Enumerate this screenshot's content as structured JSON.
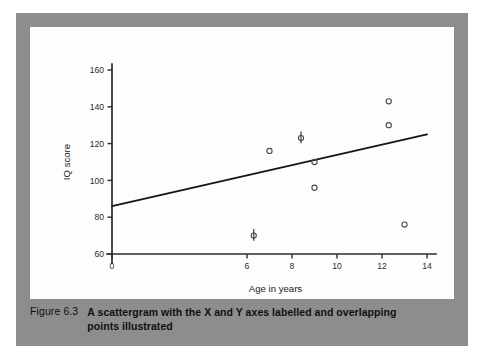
{
  "figure": {
    "caption_label": "Figure 6.3",
    "caption_text": "A scattergram with the X and Y axes labelled and overlapping points illustrated"
  },
  "colors": {
    "frame": "#8d8d8d",
    "panel": "#fdfdfd",
    "axis": "#2b2b2b",
    "trend_line": "#161616",
    "marker": "#4a4a4a"
  },
  "chart_data": {
    "type": "scatter",
    "title": "",
    "xlabel": "Age in years",
    "ylabel": "IQ score",
    "xlim": [
      0,
      14
    ],
    "ylim": [
      60,
      160
    ],
    "grid": false,
    "legend": "none",
    "x_ticks": [
      0,
      6,
      8,
      10,
      12,
      14
    ],
    "x_tick_labels": [
      "0",
      "6",
      "8",
      "10",
      "12",
      "14"
    ],
    "y_ticks": [
      60,
      80,
      100,
      120,
      140,
      160
    ],
    "y_tick_labels": [
      "60",
      "80",
      "100",
      "120",
      "140",
      "160"
    ],
    "points": [
      {
        "x": 7.0,
        "y": 116,
        "marker": "open-circle",
        "overlapping": false
      },
      {
        "x": 8.4,
        "y": 123,
        "marker": "overlapping-point",
        "overlapping": true
      },
      {
        "x": 9.0,
        "y": 110,
        "marker": "open-circle",
        "overlapping": false
      },
      {
        "x": 9.0,
        "y": 96,
        "marker": "open-circle",
        "overlapping": false
      },
      {
        "x": 6.3,
        "y": 70,
        "marker": "overlapping-point",
        "overlapping": true
      },
      {
        "x": 12.3,
        "y": 143,
        "marker": "open-circle",
        "overlapping": false
      },
      {
        "x": 12.3,
        "y": 130,
        "marker": "open-circle",
        "overlapping": false
      },
      {
        "x": 13.0,
        "y": 76,
        "marker": "open-circle",
        "overlapping": false
      }
    ],
    "trend_line": {
      "type": "line",
      "name": "regression line",
      "x": [
        0,
        14
      ],
      "y": [
        86,
        125
      ]
    },
    "annotations": [
      "Overlapping data points are drawn as a circle with a short vertical stroke through it."
    ]
  }
}
